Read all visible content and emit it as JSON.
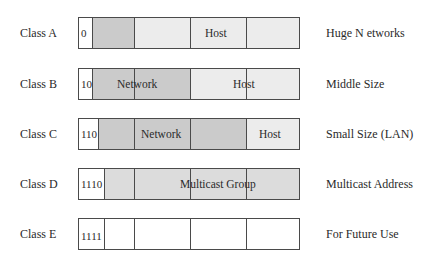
{
  "colors": {
    "dark": "#cbcbcb",
    "light": "#ececec",
    "white": "#ffffff",
    "border": "#4a4a4a"
  },
  "rows": [
    {
      "name": "Class A",
      "prefix": "0",
      "desc": "Huge N etworks",
      "field1": "",
      "field2": "Host"
    },
    {
      "name": "Class B",
      "prefix": "10",
      "desc": "Middle Size",
      "field1": "Network",
      "field2": "Host"
    },
    {
      "name": "Class C",
      "prefix": "110",
      "desc": "Small Size (LAN)",
      "field1": "Network",
      "field2": "Host"
    },
    {
      "name": "Class D",
      "prefix": "1110",
      "desc": "Multicast Address",
      "field1": "Multicast Group",
      "field2": ""
    },
    {
      "name": "Class E",
      "prefix": "1111",
      "desc": "For Future Use",
      "field1": "",
      "field2": ""
    }
  ]
}
